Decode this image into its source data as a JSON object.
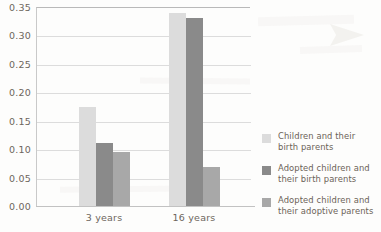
{
  "chart_data": {
    "type": "bar",
    "title": "",
    "xlabel": "",
    "ylabel": "",
    "categories": [
      "3 years",
      "16 years"
    ],
    "ylim": [
      0.0,
      0.35
    ],
    "yticks": [
      "0.00",
      "0.05",
      "0.10",
      "0.15",
      "0.20",
      "0.25",
      "0.30",
      "0.35"
    ],
    "ytick_values": [
      0.0,
      0.05,
      0.1,
      0.15,
      0.2,
      0.25,
      0.3,
      0.35
    ],
    "grid": true,
    "legend_position": "right",
    "series": [
      {
        "name": "Children and their birth parents",
        "values": [
          0.175,
          0.34
        ],
        "color": "#dcdcdc"
      },
      {
        "name": "Adopted children and their birth parents",
        "values": [
          0.111,
          0.33
        ],
        "color": "#8a8a8a"
      },
      {
        "name": "Adopted children and their adoptive parents",
        "values": [
          0.095,
          0.068
        ],
        "color": "#a8a8a8"
      }
    ]
  },
  "axis": {
    "tick_color": "#6d665c",
    "grid_color": "#dcdcdc",
    "axis_color": "#c2c2c2"
  },
  "legend": {
    "items": [
      {
        "label_line1": "Children and their",
        "label_line2": "birth parents",
        "color": "#dcdcdc"
      },
      {
        "label_line1": "Adopted children and",
        "label_line2": "their birth parents",
        "color": "#8a8a8a"
      },
      {
        "label_line1": "Adopted children and",
        "label_line2": "their adoptive parents",
        "color": "#a8a8a8"
      }
    ]
  }
}
